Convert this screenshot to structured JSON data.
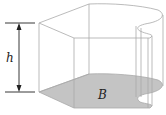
{
  "diagram": {
    "type": "generalized-cylinder",
    "labels": {
      "height": "h",
      "base": "B"
    },
    "colors": {
      "base_fill": "#c4c4c4",
      "edges": "#a9a9a9",
      "dimension_line": "#222222",
      "background": "#ffffff"
    }
  }
}
